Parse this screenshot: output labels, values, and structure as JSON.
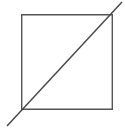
{
  "canvas": {
    "width": 125,
    "height": 130,
    "background_color": "#ffffff"
  },
  "figure": {
    "title": "Square with overshooting diagonal",
    "stroke_color": "#555555",
    "diagonal_color": "#4a4a4a",
    "stroke_width": 1.4,
    "diagonal_width": 1.5
  },
  "shapes": {
    "square": {
      "name": "square-outline",
      "x": 21,
      "y": 14,
      "width": 92,
      "height": 96,
      "left": 21,
      "top": 14,
      "right": 113,
      "bottom": 110
    },
    "diagonal": {
      "name": "diagonal-line",
      "x1": 7,
      "y1": 126,
      "x2": 122,
      "y2": 2,
      "direction": "bottom-left-to-top-right",
      "overshoot": true
    }
  }
}
